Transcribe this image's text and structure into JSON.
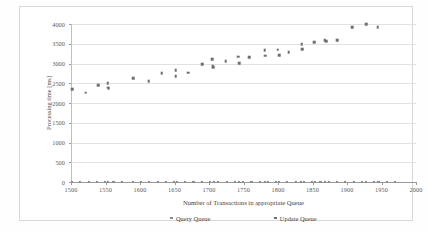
{
  "chart_data": {
    "type": "scatter",
    "title": "",
    "xlabel": "Number of Transactions in appropriate Queue",
    "ylabel": "Processing time [ms]",
    "xlim": [
      1500,
      2000
    ],
    "ylim": [
      0,
      4000
    ],
    "xticks": [
      1500,
      1550,
      1600,
      1650,
      1700,
      1750,
      1800,
      1850,
      1900,
      1950,
      2000
    ],
    "yticks": [
      0,
      500,
      1000,
      1500,
      2000,
      2500,
      3000,
      3500,
      4000
    ],
    "grid": "horizontal",
    "legend_position": "bottom",
    "series": [
      {
        "name": "Query Queue",
        "marker": "square",
        "color": "#8a8a8e",
        "points": [
          [
            1500,
            10
          ],
          [
            1512,
            10
          ],
          [
            1524,
            12
          ],
          [
            1536,
            10
          ],
          [
            1548,
            12
          ],
          [
            1552,
            10
          ],
          [
            1560,
            12
          ],
          [
            1572,
            10
          ],
          [
            1588,
            12
          ],
          [
            1600,
            10
          ],
          [
            1612,
            12
          ],
          [
            1624,
            10
          ],
          [
            1636,
            12
          ],
          [
            1648,
            10
          ],
          [
            1652,
            12
          ],
          [
            1664,
            10
          ],
          [
            1676,
            12
          ],
          [
            1688,
            10
          ],
          [
            1700,
            12
          ],
          [
            1706,
            10
          ],
          [
            1712,
            12
          ],
          [
            1724,
            10
          ],
          [
            1736,
            12
          ],
          [
            1742,
            10
          ],
          [
            1748,
            12
          ],
          [
            1760,
            10
          ],
          [
            1772,
            12
          ],
          [
            1780,
            10
          ],
          [
            1784,
            12
          ],
          [
            1796,
            10
          ],
          [
            1800,
            12
          ],
          [
            1812,
            10
          ],
          [
            1824,
            12
          ],
          [
            1832,
            10
          ],
          [
            1836,
            12
          ],
          [
            1848,
            10
          ],
          [
            1852,
            12
          ],
          [
            1860,
            10
          ],
          [
            1866,
            12
          ],
          [
            1872,
            10
          ],
          [
            1884,
            12
          ],
          [
            1896,
            10
          ],
          [
            1908,
            12
          ],
          [
            1920,
            10
          ],
          [
            1926,
            12
          ],
          [
            1938,
            10
          ],
          [
            1944,
            12
          ],
          [
            1956,
            10
          ],
          [
            1968,
            12
          ]
        ]
      },
      {
        "name": "Update Queue",
        "marker": "square",
        "color": "#6e6e72",
        "points": [
          [
            1500,
            2350
          ],
          [
            1520,
            2260
          ],
          [
            1538,
            2450
          ],
          [
            1552,
            2500
          ],
          [
            1552,
            2390
          ],
          [
            1553,
            2370
          ],
          [
            1589,
            2635
          ],
          [
            1611,
            2545
          ],
          [
            1630,
            2760
          ],
          [
            1650,
            2830
          ],
          [
            1650,
            2680
          ],
          [
            1668,
            2770
          ],
          [
            1689,
            2985
          ],
          [
            1703,
            3110
          ],
          [
            1704,
            2935
          ],
          [
            1705,
            2910
          ],
          [
            1723,
            3065
          ],
          [
            1741,
            3175
          ],
          [
            1742,
            3010
          ],
          [
            1757,
            3165
          ],
          [
            1779,
            3330
          ],
          [
            1780,
            3195
          ],
          [
            1798,
            3350
          ],
          [
            1800,
            3210
          ],
          [
            1814,
            3280
          ],
          [
            1833,
            3490
          ],
          [
            1834,
            3365
          ],
          [
            1851,
            3545
          ],
          [
            1866,
            3585
          ],
          [
            1868,
            3560
          ],
          [
            1884,
            3585
          ],
          [
            1906,
            3920
          ],
          [
            1926,
            4000
          ],
          [
            1943,
            3920
          ]
        ]
      }
    ]
  },
  "legend": {
    "entries": [
      {
        "label": "Query Queue"
      },
      {
        "label": "Update Queue"
      }
    ]
  }
}
